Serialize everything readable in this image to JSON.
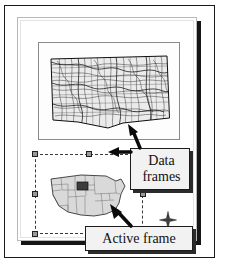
{
  "figure": {
    "kind": "gis-layout-view"
  },
  "page": {
    "sheet_color": "#ffffff",
    "border_color": "#b9b9b9",
    "shadow_color": "#151515"
  },
  "frames": [
    {
      "id": "detail-frame",
      "name": "detail-data-frame",
      "map_subject": "South Dakota roads and hydrography",
      "active": false,
      "border_color": "#8a8a8a"
    },
    {
      "id": "active-frame",
      "name": "overview-data-frame",
      "map_subject": "United States states with South Dakota highlighted",
      "active": true,
      "selection_style": "dashed",
      "handle_count": 8,
      "handle_fill": "#9a9a9a",
      "handle_border": "#222222"
    }
  ],
  "callouts": [
    {
      "name": "data-frames-callout",
      "line1": "Data",
      "line2": "frames",
      "text": "Data frames",
      "fill": "#f2f2f2",
      "border": "#1c1c1c",
      "arrow_targets": [
        "detail-data-frame",
        "overview-data-frame"
      ]
    },
    {
      "name": "active-frame-callout",
      "line1": "Active frame",
      "line2": "",
      "text": "Active frame",
      "fill": "#f2f2f2",
      "border": "#1c1c1c",
      "arrow_targets": [
        "overview-data-frame-selection-handle"
      ]
    }
  ],
  "compass": {
    "name": "north-arrow",
    "label": "",
    "color": "#3a3a3a"
  },
  "colors": {
    "ink": "#111111",
    "outer_frame": "#1a1a1a",
    "map_fill": "#d9d9d9",
    "map_line": "#4a4a4a",
    "highlight": "#3c3c3c"
  }
}
